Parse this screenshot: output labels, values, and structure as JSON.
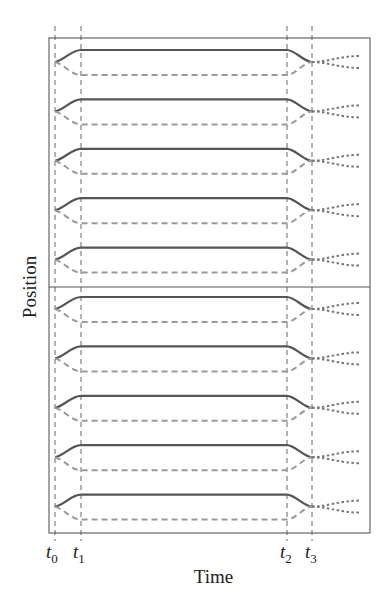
{
  "chart_data": {
    "type": "line",
    "title": "",
    "xlabel": "Time",
    "ylabel": "Position",
    "x_ticks": [
      {
        "name": "t",
        "sub": "0",
        "x": 55
      },
      {
        "name": "t",
        "sub": "1",
        "x": 81
      },
      {
        "name": "t",
        "sub": "2",
        "x": 287
      },
      {
        "name": "t",
        "sub": "3",
        "x": 312
      }
    ],
    "frame": {
      "left": 49,
      "top": 38,
      "right": 370,
      "bottom": 533
    },
    "midline_y": 287,
    "pair_count": 10,
    "pair_spacing": 49.4,
    "first_pair": {
      "start_y": 62,
      "solid_y": 50,
      "dashed_y": 75,
      "end_y": 62
    },
    "fan_end_x": 360,
    "fan_spread": [
      -6,
      6
    ],
    "series": [
      {
        "name": "solid-upper",
        "style": "solid",
        "color": "#555555"
      },
      {
        "name": "dashed-lower",
        "style": "dashed",
        "color": "#9a9a9a"
      },
      {
        "name": "dotted-fan",
        "style": "dotted",
        "color": "#777777"
      }
    ],
    "grid": false,
    "legend": "none"
  },
  "labels": {
    "xlabel": "Time",
    "ylabel": "Position",
    "t0": "t",
    "t0_sub": "0",
    "t1": "t",
    "t1_sub": "1",
    "t2": "t",
    "t2_sub": "2",
    "t3": "t",
    "t3_sub": "3"
  }
}
